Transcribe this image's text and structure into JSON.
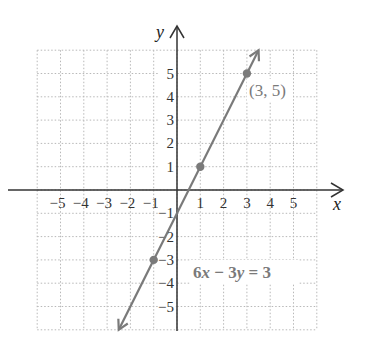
{
  "chart_data": {
    "type": "line",
    "title": "",
    "xlabel": "x",
    "ylabel": "y",
    "xlim": [
      -6,
      6
    ],
    "ylim": [
      -6,
      6
    ],
    "grid": true,
    "grid_style": "dotted",
    "x_ticks": [
      -5,
      -4,
      -3,
      -2,
      -1,
      1,
      2,
      3,
      4,
      5
    ],
    "x_tick_labels": [
      "−5",
      "−4",
      "−3",
      "−2",
      "−1",
      "1",
      "2",
      "3",
      "4",
      "5"
    ],
    "y_ticks": [
      -5,
      -4,
      -3,
      -2,
      -1,
      1,
      2,
      3,
      4,
      5
    ],
    "y_tick_labels": [
      "−5",
      "−4",
      "−3",
      "−2",
      "−1",
      "1",
      "2",
      "3",
      "4",
      "5"
    ],
    "series": [
      {
        "name": "6x − 3y = 3",
        "equation": "6x − 3y = 3",
        "slope": 2,
        "intercept": -1,
        "x": [
          -2.5,
          3.5
        ],
        "y": [
          -6,
          6
        ],
        "arrows": "both",
        "color": "#7a7a7a"
      }
    ],
    "points": [
      {
        "x": -1,
        "y": -3,
        "label": ""
      },
      {
        "x": 1,
        "y": 1,
        "label": ""
      },
      {
        "x": 3,
        "y": 5,
        "label": "(3, 5)"
      }
    ],
    "annotations": [
      {
        "text": "(3, 5)",
        "x": 3.1,
        "y": 4.3
      },
      {
        "parts": [
          "6",
          "x",
          " − 3",
          "y",
          " = 3"
        ],
        "text": "6x − 3y = 3",
        "x": 0.7,
        "y": -3.5
      }
    ]
  },
  "labels": {
    "x_axis": "x",
    "y_axis": "y",
    "point_label": "(3, 5)",
    "eq_coef1": "6",
    "eq_var1": "x",
    "eq_mid": " − 3",
    "eq_var2": "y",
    "eq_end": " = 3"
  },
  "colors": {
    "line": "#7a7a7a",
    "point": "#7a7a7a",
    "axis": "#333333",
    "grid": "#b8b8b8",
    "annotation": "#7a7a7a",
    "tick_label": "#333333"
  }
}
